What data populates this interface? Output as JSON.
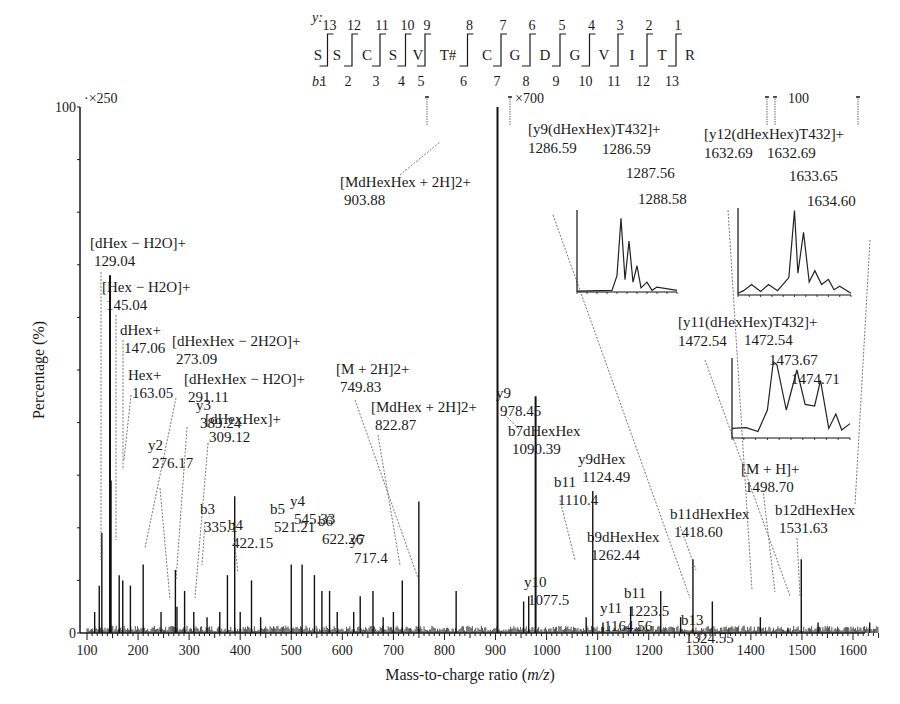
{
  "sequence": {
    "y_label": "y:",
    "b_label": "b:",
    "residues": [
      "S",
      "S",
      "C",
      "S",
      "V",
      "T#",
      "C",
      "G",
      "D",
      "G",
      "V",
      "I",
      "T",
      "R"
    ],
    "y_numbers": [
      "13",
      "12",
      "11",
      "10",
      "9",
      "8",
      "7",
      "6",
      "5",
      "4",
      "3",
      "2",
      "1"
    ],
    "b_numbers": [
      "1",
      "2",
      "3",
      "4",
      "5",
      "6",
      "7",
      "8",
      "9",
      "10",
      "11",
      "12",
      "13"
    ]
  },
  "chart_data": {
    "type": "bar",
    "title": "",
    "xlabel": "Mass-to-charge ratio (m/z)",
    "ylabel": "Percentage (%)",
    "xlim": [
      90,
      1660
    ],
    "ylim": [
      0,
      100
    ],
    "x_ticks": [
      100,
      200,
      300,
      400,
      500,
      600,
      700,
      800,
      900,
      1000,
      1100,
      1200,
      1300,
      1400,
      1500,
      1600
    ],
    "y_ticks": [
      0,
      100
    ],
    "grid": false,
    "magnification_markers": [
      {
        "label": "×250",
        "from_mz": 100,
        "to_mz": 720
      },
      {
        "label": "×700",
        "from_mz": 950,
        "to_mz": 1470
      },
      {
        "label": "×100",
        "from_mz": 1500,
        "to_mz": 1650
      }
    ],
    "peaks": [
      {
        "mz": 129.04,
        "height": 19
      },
      {
        "mz": 145.04,
        "height": 68
      },
      {
        "mz": 147.06,
        "height": 29
      },
      {
        "mz": 163.05,
        "height": 11
      },
      {
        "mz": 115,
        "height": 4
      },
      {
        "mz": 124,
        "height": 9
      },
      {
        "mz": 170,
        "height": 10
      },
      {
        "mz": 185,
        "height": 9
      },
      {
        "mz": 210,
        "height": 13
      },
      {
        "mz": 245,
        "height": 4
      },
      {
        "mz": 273.09,
        "height": 12
      },
      {
        "mz": 276.17,
        "height": 5
      },
      {
        "mz": 291.11,
        "height": 8
      },
      {
        "mz": 309.12,
        "height": 4
      },
      {
        "mz": 335.1,
        "height": 3
      },
      {
        "mz": 360,
        "height": 4
      },
      {
        "mz": 375,
        "height": 11
      },
      {
        "mz": 389.24,
        "height": 26
      },
      {
        "mz": 400,
        "height": 4
      },
      {
        "mz": 422.15,
        "height": 10
      },
      {
        "mz": 440,
        "height": 3
      },
      {
        "mz": 500,
        "height": 13
      },
      {
        "mz": 521.21,
        "height": 13
      },
      {
        "mz": 545.33,
        "height": 11
      },
      {
        "mz": 560,
        "height": 8
      },
      {
        "mz": 575,
        "height": 8
      },
      {
        "mz": 590,
        "height": 4
      },
      {
        "mz": 622.26,
        "height": 4
      },
      {
        "mz": 635,
        "height": 7
      },
      {
        "mz": 660,
        "height": 8
      },
      {
        "mz": 680,
        "height": 3
      },
      {
        "mz": 700,
        "height": 4
      },
      {
        "mz": 717.4,
        "height": 10
      },
      {
        "mz": 749.83,
        "height": 25
      },
      {
        "mz": 822.87,
        "height": 8
      },
      {
        "mz": 903.88,
        "height": 100
      },
      {
        "mz": 955,
        "height": 6
      },
      {
        "mz": 965,
        "height": 7
      },
      {
        "mz": 978.45,
        "height": 45
      },
      {
        "mz": 1077.5,
        "height": 3
      },
      {
        "mz": 1090.39,
        "height": 27
      },
      {
        "mz": 1110.4,
        "height": 2
      },
      {
        "mz": 1164.56,
        "height": 5
      },
      {
        "mz": 1223.5,
        "height": 8
      },
      {
        "mz": 1262.44,
        "height": 3
      },
      {
        "mz": 1286.59,
        "height": 14
      },
      {
        "mz": 1324.55,
        "height": 6
      },
      {
        "mz": 1418.6,
        "height": 3
      },
      {
        "mz": 1472.54,
        "height": 1
      },
      {
        "mz": 1498.7,
        "height": 14
      },
      {
        "mz": 1531.63,
        "height": 2
      },
      {
        "mz": 1632.69,
        "height": 2
      }
    ],
    "annotations": [
      {
        "ion": "[dHex − H2O]+",
        "mz": "129.04"
      },
      {
        "ion": "[Hex − H2O]+",
        "mz": "145.04"
      },
      {
        "ion": "dHex+",
        "mz": "147.06"
      },
      {
        "ion": "Hex+",
        "mz": "163.05"
      },
      {
        "ion": "[dHexHex − 2H2O]+",
        "mz": "273.09"
      },
      {
        "ion": "[dHexHex − H2O]+",
        "mz": "291.11"
      },
      {
        "ion": "[dHexHex]+",
        "mz": "309.12"
      },
      {
        "ion": "y2",
        "mz": "276.17"
      },
      {
        "ion": "y3",
        "mz": "389.24"
      },
      {
        "ion": "b3",
        "mz": "335.1"
      },
      {
        "ion": "b4",
        "mz": "422.15"
      },
      {
        "ion": "b5",
        "mz": "521.21"
      },
      {
        "ion": "y4",
        "mz": "545.33"
      },
      {
        "ion": "b6",
        "mz": "622.26"
      },
      {
        "ion": "y7",
        "mz": "717.4"
      },
      {
        "ion": "[M + 2H]2+",
        "mz": "749.83"
      },
      {
        "ion": "[MdHex + 2H]2+",
        "mz": "822.87"
      },
      {
        "ion": "[MdHexHex + 2H]2+",
        "mz": "903.88"
      },
      {
        "ion": "y9",
        "mz": "978.45"
      },
      {
        "ion": "b7dHexHex",
        "mz": "1090.39"
      },
      {
        "ion": "y9dHex",
        "mz": "1124.49"
      },
      {
        "ion": "b11",
        "mz": "1110.4"
      },
      {
        "ion": "b9dHexHex",
        "mz": "1262.44"
      },
      {
        "ion": "y10",
        "mz": "1077.5"
      },
      {
        "ion": "y11",
        "mz": "1164.56"
      },
      {
        "ion": "b11",
        "mz": "1223.5"
      },
      {
        "ion": "b13",
        "mz": "1324.55"
      },
      {
        "ion": "b11dHexHex",
        "mz": "1418.60"
      },
      {
        "ion": "[M + H]+",
        "mz": "1498.70"
      },
      {
        "ion": "b12dHexHex",
        "mz": "1531.63"
      },
      {
        "ion": "[y9(dHexHex)T432]+",
        "mz": "1286.59"
      },
      {
        "ion": "[y12(dHexHex)T432]+",
        "mz": "1632.69"
      },
      {
        "ion": "[y11(dHexHex)T432]+",
        "mz": "1472.54"
      }
    ],
    "insets": [
      {
        "title": "[y9(dHexHex)T432]+",
        "mono": "1286.59",
        "peaks": [
          "1286.59",
          "1287.56",
          "1288.58"
        ]
      },
      {
        "title": "[y12(dHexHex)T432]+",
        "mono": "1632.69",
        "peaks": [
          "1632.69",
          "1633.65",
          "1634.60"
        ]
      },
      {
        "title": "[y11(dHexHex)T432]+",
        "mono": "1472.54",
        "peaks": [
          "1472.54",
          "1473.67",
          "1474.71"
        ]
      }
    ]
  },
  "labels": {
    "y100": "100",
    "y0": "0",
    "x250": "×250",
    "x700": "×700",
    "x100": "100",
    "xaxis": "Mass-to-charge ratio (",
    "xaxis_mz": "m/z",
    "xaxis_end": ")",
    "yaxis": "Percentage (%)"
  }
}
